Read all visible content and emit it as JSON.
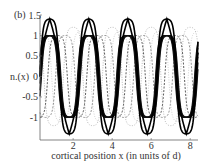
{
  "panel_label": "(b)",
  "chart_data": {
    "type": "line",
    "title": "",
    "panel": "(b)",
    "xlabel": "cortical position x (in units of d)",
    "ylabel": "n.(x)",
    "xlim": [
      0.3,
      8.4
    ],
    "ylim": [
      -1.55,
      1.5
    ],
    "x_ticks": [
      2,
      4,
      6,
      8
    ],
    "x_tick_labels": [
      "2",
      "4",
      "6",
      "8"
    ],
    "y_ticks": [
      1.5,
      1,
      0.5,
      0,
      -0.5,
      -1
    ],
    "y_tick_labels": [
      "1.5",
      "1",
      "0.5",
      "0",
      "-0.5",
      "-1"
    ],
    "grid": false,
    "legend": null,
    "series": [
      {
        "name": "thick solid (final state)",
        "style": "solid",
        "color": "#000000",
        "width": 1.6,
        "amplitude": 1.4,
        "period": 2.0,
        "peak_x": 0.8,
        "peak_positions_x": [
          0.8,
          2.8,
          4.8,
          6.8
        ],
        "peak_value": 1.4,
        "trough_value": -1.4
      },
      {
        "name": "thick dark band",
        "style": "band",
        "color": "#111111",
        "amplitude": 1.0,
        "period": 2.0,
        "peak_x": 0.8
      },
      {
        "name": "dashed dark",
        "style": "dashed",
        "color": "#333333",
        "amplitude": 1.0,
        "period": 2.0,
        "peak_x": 1.2
      },
      {
        "name": "dashed mid",
        "style": "dashed",
        "color": "#777777",
        "amplitude": 1.0,
        "period": 2.0,
        "peak_x": 1.6
      },
      {
        "name": "dotted light",
        "style": "dotted",
        "color": "#aaaaaa",
        "amplitude": 1.2,
        "period": 2.0,
        "peak_x": 2.0
      },
      {
        "name": "dotted lightest",
        "style": "dotted",
        "color": "#c8c8c8",
        "amplitude": 1.1,
        "period": 2.0,
        "peak_x": 0.4
      }
    ]
  }
}
